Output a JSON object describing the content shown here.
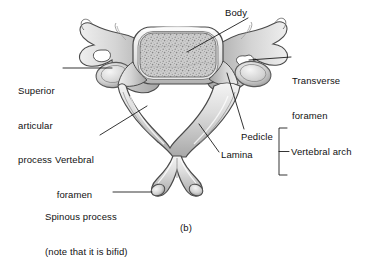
{
  "figure": {
    "caption": "(b)",
    "background_color": "#ffffff",
    "line_color": "#111111",
    "bone_fill": "#d9d9d9",
    "bone_shadow": "#9a9a9a",
    "bone_highlight": "#f2f2f2",
    "trabecular_fill": "#c9c9c9"
  },
  "labels": {
    "body": "Body",
    "transverse_foramen_line1": "Transverse",
    "transverse_foramen_line2": "foramen",
    "superior_articular_line1": "Superior",
    "superior_articular_line2": "articular",
    "superior_articular_line3": "process",
    "vertebral_foramen_line1": "Vertebral",
    "vertebral_foramen_line2": "foramen",
    "pedicle": "Pedicle",
    "lamina": "Lamina",
    "vertebral_arch": "Vertebral arch",
    "spinous_line1": "Spinous process",
    "spinous_line2": "(note that it is bifid)"
  }
}
